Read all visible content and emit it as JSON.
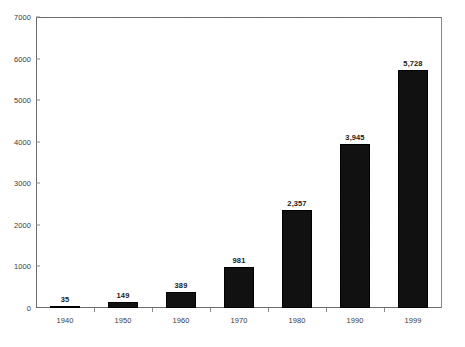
{
  "chart_data": {
    "type": "bar",
    "title": "",
    "xlabel": "",
    "ylabel": "",
    "categories": [
      "1940",
      "1950",
      "1960",
      "1970",
      "1980",
      "1990",
      "1999"
    ],
    "values": [
      35,
      149,
      389,
      981,
      2357,
      3945,
      5728
    ],
    "value_labels": [
      "35",
      "149",
      "389",
      "981",
      "2,357",
      "3,945",
      "5,728"
    ],
    "ylim": [
      0,
      7000
    ],
    "y_ticks": [
      0,
      1000,
      2000,
      3000,
      4000,
      5000,
      6000,
      7000
    ],
    "y_tick_labels": [
      "0",
      "1000",
      "2000",
      "3000",
      "4000",
      "5000",
      "6000",
      "7000"
    ],
    "grid": false,
    "legend": null,
    "series": [
      {
        "name": "",
        "values": [
          35,
          149,
          389,
          981,
          2357,
          3945,
          5728
        ]
      }
    ],
    "colors": {
      "bar": "#111111",
      "axis": "#6b6b6b",
      "text": "#3a3a3a",
      "background": "#ffffff"
    }
  }
}
